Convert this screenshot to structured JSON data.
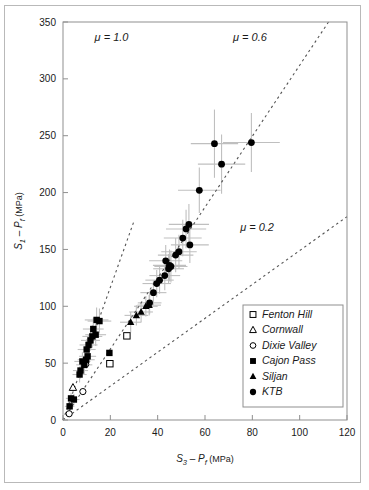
{
  "figure": {
    "background_color": "#ffffff",
    "frame_color": "#b9b9b9",
    "axis_color": "#8f8f8f",
    "marker_color": "#000000",
    "errorbar_color": "#bfbfbf",
    "guide_line_color": "#555555"
  },
  "chart_data": {
    "type": "scatter",
    "title": "",
    "xlabel": "S3 - Pf (MPa)",
    "ylabel": "S1 - Pf (MPa)",
    "xlabel_parts": {
      "main": "S",
      "sub1": "3",
      "op": " – ",
      "main2": "P",
      "sub2": "f",
      "unit": " (MPa)"
    },
    "ylabel_parts": {
      "main": "S",
      "sub1": "1",
      "op": " – ",
      "main2": "P",
      "sub2": "f",
      "unit": " (MPa)"
    },
    "xlim": [
      0,
      120
    ],
    "ylim": [
      0,
      350
    ],
    "xticks": [
      0,
      20,
      40,
      60,
      80,
      100,
      120
    ],
    "yticks": [
      0,
      50,
      100,
      150,
      200,
      250,
      300,
      350
    ],
    "grid": false,
    "legend_position": "lower-right",
    "annotations": [
      {
        "text": "μ = 1.0",
        "x": 20.5,
        "y": 333,
        "name": "mu-1p0-label"
      },
      {
        "text": "μ = 0.6",
        "x": 79.0,
        "y": 333,
        "name": "mu-0p6-label"
      },
      {
        "text": "μ = 0.2",
        "x": 82.0,
        "y": 166,
        "name": "mu-0p2-label"
      }
    ],
    "guide_lines": [
      {
        "name": "mu-1p0-line",
        "mu": 1.0,
        "slope": 5.83,
        "x_from": 0,
        "x_to": 30.0,
        "dashed": true
      },
      {
        "name": "mu-0p6-line",
        "mu": 0.6,
        "slope": 3.12,
        "x_from": 0,
        "x_to": 112.2,
        "dashed": true
      },
      {
        "name": "mu-0p2-line",
        "mu": 0.2,
        "slope": 1.49,
        "x_from": 0,
        "x_to": 120.0,
        "dashed": true
      }
    ],
    "series": [
      {
        "name": "Fenton Hill",
        "marker": "open-square",
        "points": [
          {
            "x": 27.0,
            "y": 74.0,
            "xerr": 0,
            "yerr": 0
          },
          {
            "x": 19.8,
            "y": 49.5,
            "xerr": 0,
            "yerr": 0
          }
        ]
      },
      {
        "name": "Cornwall",
        "marker": "open-triangle",
        "points": [
          {
            "x": 4.2,
            "y": 28.5,
            "xerr": 0,
            "yerr": 0
          }
        ]
      },
      {
        "name": "Dixie Valley",
        "marker": "open-circle",
        "points": [
          {
            "x": 8.4,
            "y": 25.0,
            "xerr": 0,
            "yerr": 0
          },
          {
            "x": 2.6,
            "y": 5.5,
            "xerr": 0,
            "yerr": 0
          },
          {
            "x": 9.6,
            "y": 49.0,
            "xerr": 0,
            "yerr": 0
          }
        ]
      },
      {
        "name": "Cajon Pass",
        "marker": "filled-square",
        "points": [
          {
            "x": 2.8,
            "y": 12.0,
            "xerr": 2.0,
            "yerr": 4.0
          },
          {
            "x": 3.4,
            "y": 19.0,
            "xerr": 2.2,
            "yerr": 5.0
          },
          {
            "x": 4.6,
            "y": 18.0,
            "xerr": 2.4,
            "yerr": 5.0
          },
          {
            "x": 7.0,
            "y": 40.0,
            "xerr": 3.0,
            "yerr": 7.0
          },
          {
            "x": 7.4,
            "y": 43.5,
            "xerr": 3.2,
            "yerr": 7.0
          },
          {
            "x": 9.0,
            "y": 48.5,
            "xerr": 3.4,
            "yerr": 8.0
          },
          {
            "x": 9.8,
            "y": 53.0,
            "xerr": 3.6,
            "yerr": 8.0
          },
          {
            "x": 10.4,
            "y": 56.0,
            "xerr": 3.6,
            "yerr": 8.0
          },
          {
            "x": 10.0,
            "y": 62.0,
            "xerr": 3.8,
            "yerr": 9.0
          },
          {
            "x": 10.8,
            "y": 66.0,
            "xerr": 3.8,
            "yerr": 9.0
          },
          {
            "x": 11.6,
            "y": 70.0,
            "xerr": 4.0,
            "yerr": 9.0
          },
          {
            "x": 12.4,
            "y": 73.5,
            "xerr": 4.2,
            "yerr": 10.0
          },
          {
            "x": 13.8,
            "y": 75.0,
            "xerr": 4.4,
            "yerr": 10.0
          },
          {
            "x": 12.8,
            "y": 80.0,
            "xerr": 4.4,
            "yerr": 10.0
          },
          {
            "x": 14.2,
            "y": 88.0,
            "xerr": 5.0,
            "yerr": 11.0
          },
          {
            "x": 15.4,
            "y": 87.0,
            "xerr": 5.0,
            "yerr": 11.0
          },
          {
            "x": 19.6,
            "y": 59.0,
            "xerr": 0,
            "yerr": 0
          },
          {
            "x": 8.2,
            "y": 51.5,
            "xerr": 3.4,
            "yerr": 8.0
          }
        ]
      },
      {
        "name": "Siljan",
        "marker": "filled-triangle",
        "points": [
          {
            "x": 31.0,
            "y": 92.0,
            "xerr": 5.0,
            "yerr": 9.0
          },
          {
            "x": 33.0,
            "y": 95.0,
            "xerr": 5.0,
            "yerr": 9.0
          },
          {
            "x": 35.0,
            "y": 100.0,
            "xerr": 5.0,
            "yerr": 9.0
          },
          {
            "x": 36.4,
            "y": 101.0,
            "xerr": 5.0,
            "yerr": 9.0
          },
          {
            "x": 28.6,
            "y": 86.0,
            "xerr": 4.5,
            "yerr": 9.0
          }
        ]
      },
      {
        "name": "KTB",
        "marker": "filled-circle",
        "points": [
          {
            "x": 36.6,
            "y": 103.0,
            "xerr": 5.0,
            "yerr": 10.0
          },
          {
            "x": 38.2,
            "y": 112.0,
            "xerr": 5.5,
            "yerr": 11.0
          },
          {
            "x": 39.6,
            "y": 120.0,
            "xerr": 6.0,
            "yerr": 12.0
          },
          {
            "x": 40.8,
            "y": 123.0,
            "xerr": 6.0,
            "yerr": 12.0
          },
          {
            "x": 43.0,
            "y": 127.0,
            "xerr": 6.5,
            "yerr": 13.0
          },
          {
            "x": 44.6,
            "y": 133.0,
            "xerr": 6.5,
            "yerr": 13.0
          },
          {
            "x": 45.0,
            "y": 136.0,
            "xerr": 7.0,
            "yerr": 14.0
          },
          {
            "x": 45.6,
            "y": 135.0,
            "xerr": 7.0,
            "yerr": 14.0
          },
          {
            "x": 43.4,
            "y": 140.0,
            "xerr": 7.0,
            "yerr": 14.0
          },
          {
            "x": 47.6,
            "y": 145.0,
            "xerr": 7.5,
            "yerr": 15.0
          },
          {
            "x": 49.0,
            "y": 148.0,
            "xerr": 7.5,
            "yerr": 15.0
          },
          {
            "x": 53.6,
            "y": 154.0,
            "xerr": 8.0,
            "yerr": 16.0
          },
          {
            "x": 50.6,
            "y": 160.0,
            "xerr": 8.0,
            "yerr": 16.0
          },
          {
            "x": 52.0,
            "y": 168.0,
            "xerr": 8.5,
            "yerr": 17.0
          },
          {
            "x": 53.2,
            "y": 172.0,
            "xerr": 8.5,
            "yerr": 18.0
          },
          {
            "x": 57.6,
            "y": 202.0,
            "xerr": 9.0,
            "yerr": 20.0
          },
          {
            "x": 67.0,
            "y": 225.0,
            "xerr": 10.0,
            "yerr": 26.0
          },
          {
            "x": 64.0,
            "y": 243.0,
            "xerr": 10.0,
            "yerr": 30.0
          },
          {
            "x": 79.6,
            "y": 244.0,
            "xerr": 12.0,
            "yerr": 26.0
          }
        ]
      }
    ],
    "legend": [
      {
        "label": "Fenton Hill",
        "marker": "open-square"
      },
      {
        "label": "Cornwall",
        "marker": "open-triangle"
      },
      {
        "label": "Dixie Valley",
        "marker": "open-circle"
      },
      {
        "label": "Cajon Pass",
        "marker": "filled-square"
      },
      {
        "label": "Siljan",
        "marker": "filled-triangle"
      },
      {
        "label": "KTB",
        "marker": "filled-circle"
      }
    ]
  }
}
